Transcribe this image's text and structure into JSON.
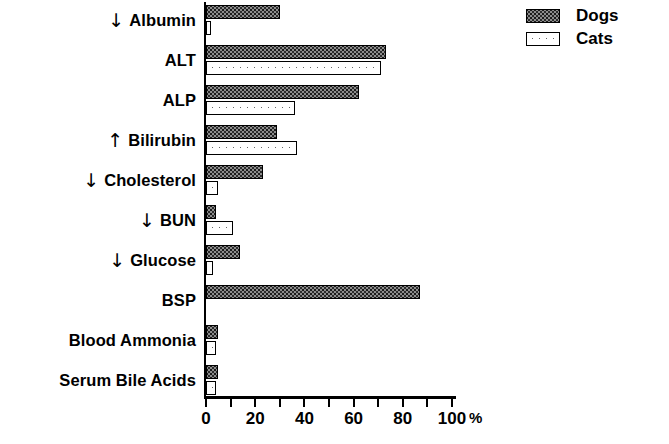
{
  "chart_data": {
    "type": "bar",
    "orientation": "horizontal",
    "title": "",
    "xlabel": "%",
    "ylabel": "",
    "xlim": [
      0,
      100
    ],
    "xticks": [
      0,
      10,
      20,
      30,
      40,
      50,
      60,
      70,
      80,
      90,
      100
    ],
    "xtick_labels": [
      "0",
      "",
      "20",
      "",
      "40",
      "",
      "60",
      "",
      "80",
      "",
      "100"
    ],
    "axis_unit": "%",
    "grid": false,
    "legend_position": "top-right",
    "categories": [
      "Albumin",
      "ALT",
      "ALP",
      "Bilirubin",
      "Cholesterol",
      "BUN",
      "Glucose",
      "BSP",
      "Blood Ammonia",
      "Serum Bile Acids"
    ],
    "category_arrows": [
      "↓",
      "",
      "",
      "↑",
      "↓",
      "↓",
      "↓",
      "",
      "",
      ""
    ],
    "series": [
      {
        "name": "Dogs",
        "values": [
          30,
          73,
          62,
          29,
          23,
          4,
          14,
          87,
          5,
          5
        ]
      },
      {
        "name": "Cats",
        "values": [
          2,
          71,
          36,
          37,
          5,
          11,
          3,
          0,
          4,
          4
        ]
      }
    ]
  },
  "legend": {
    "items": [
      {
        "label": "Dogs",
        "pattern": "dark-hatch"
      },
      {
        "label": "Cats",
        "pattern": "light-dot"
      }
    ]
  }
}
